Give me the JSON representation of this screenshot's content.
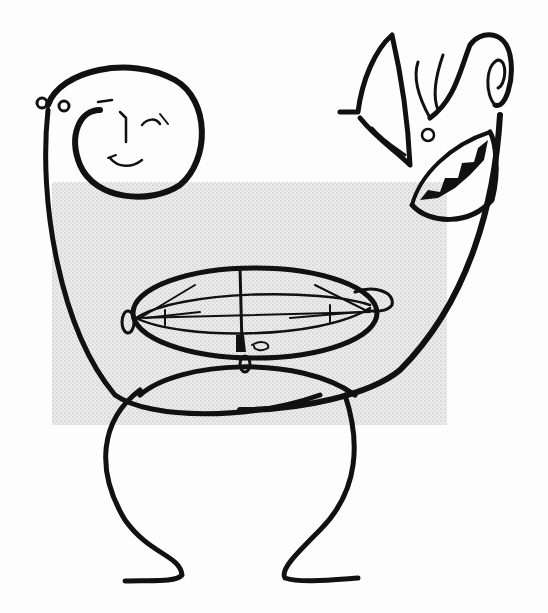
{
  "illustration": {
    "subject": "whimsical line-drawing creature holding an airship",
    "colors": {
      "ink": "#111111",
      "paper": "#fdfdfd",
      "stipple_background": "#e6e6e6"
    },
    "elements": [
      "smiling-moon-face-head",
      "dragon-head-with-open-jaw",
      "airship-ellipse-with-rigging",
      "omega-shaped-legs",
      "stippled-rectangle-backdrop"
    ]
  }
}
